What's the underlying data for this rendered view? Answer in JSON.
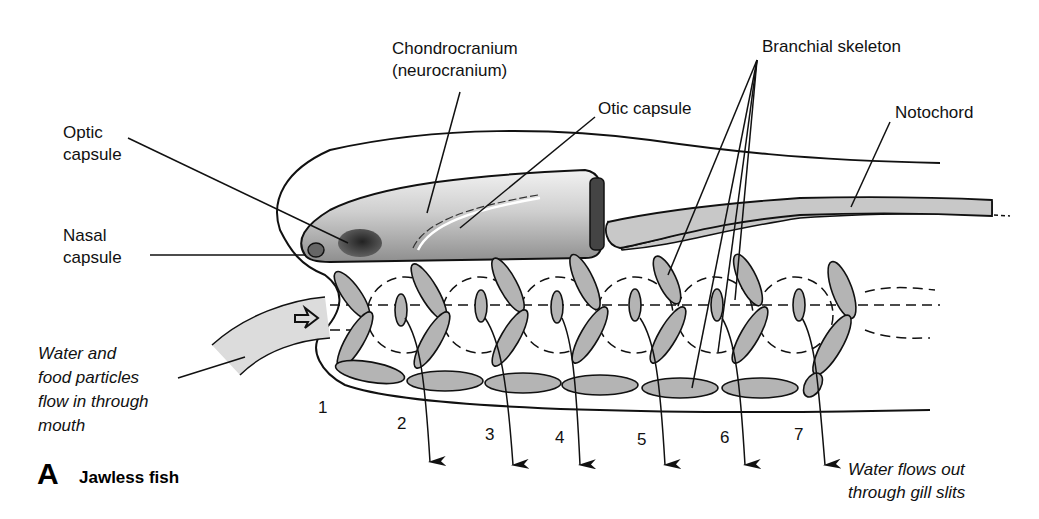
{
  "panel": {
    "letter": "A",
    "title": "Jawless fish"
  },
  "labels": {
    "chondrocranium_line1": "Chondrocranium",
    "chondrocranium_line2": "(neurocranium)",
    "branchial_skeleton": "Branchial skeleton",
    "otic_capsule": "Otic capsule",
    "notochord": "Notochord",
    "optic_line1": "Optic",
    "optic_line2": "capsule",
    "nasal_line1": "Nasal",
    "nasal_line2": "capsule",
    "water_in_line1": "Water and",
    "water_in_line2": "food particles",
    "water_in_line3": "flow in through",
    "water_in_line4": "mouth",
    "water_out_line1": "Water flows out",
    "water_out_line2": "through gill slits"
  },
  "gill_numbers": [
    "1",
    "2",
    "3",
    "4",
    "5",
    "6",
    "7"
  ],
  "colors": {
    "cartilage": "#b4b4b4",
    "line": "#111111",
    "skull_dark": "#8a8a8a",
    "skull_light": "#e6e6e6"
  }
}
